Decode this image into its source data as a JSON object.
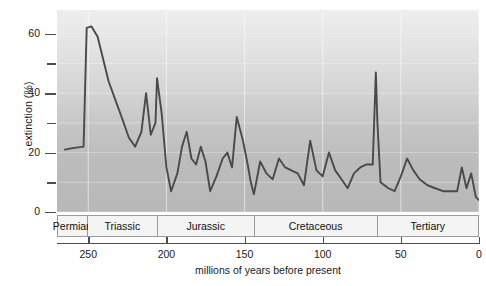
{
  "chart_data": {
    "type": "line",
    "title": "",
    "xlabel": "millions of years before present",
    "ylabel": "extinction (%)",
    "xlim": [
      270,
      0
    ],
    "ylim": [
      0,
      68
    ],
    "x_reversed": true,
    "grid": true,
    "legend": null,
    "y_ticks_major": [
      0,
      20,
      40,
      60
    ],
    "y_ticks_minor": [
      10,
      30,
      50
    ],
    "x_ticks": [
      250,
      200,
      150,
      100,
      50,
      0
    ],
    "period_bands": [
      {
        "label": "Permian",
        "start": 270,
        "end": 251
      },
      {
        "label": "Triassic",
        "start": 251,
        "end": 206
      },
      {
        "label": "Jurassic",
        "start": 206,
        "end": 144
      },
      {
        "label": "Cretaceous",
        "start": 144,
        "end": 65
      },
      {
        "label": "Tertiary",
        "start": 65,
        "end": 0
      }
    ],
    "series": [
      {
        "name": "extinction rate",
        "color": "#4a4a4a",
        "points": [
          [
            265,
            21
          ],
          [
            260,
            21.5
          ],
          [
            253,
            22
          ],
          [
            251,
            62
          ],
          [
            248,
            62.5
          ],
          [
            244,
            59
          ],
          [
            237,
            44
          ],
          [
            228,
            31
          ],
          [
            224,
            25
          ],
          [
            220,
            22
          ],
          [
            216,
            27
          ],
          [
            213,
            40
          ],
          [
            210,
            26
          ],
          [
            207,
            30
          ],
          [
            206,
            45
          ],
          [
            203,
            33
          ],
          [
            200,
            15
          ],
          [
            197,
            7
          ],
          [
            193,
            13
          ],
          [
            190,
            22
          ],
          [
            187,
            27
          ],
          [
            184,
            18
          ],
          [
            181,
            16
          ],
          [
            178,
            22
          ],
          [
            175,
            17
          ],
          [
            172,
            7
          ],
          [
            168,
            12
          ],
          [
            164,
            18
          ],
          [
            161,
            20
          ],
          [
            158,
            15
          ],
          [
            155,
            32
          ],
          [
            151,
            24
          ],
          [
            148,
            16
          ],
          [
            146,
            10
          ],
          [
            144,
            6
          ],
          [
            140,
            17
          ],
          [
            136,
            13
          ],
          [
            132,
            11
          ],
          [
            128,
            18
          ],
          [
            124,
            15
          ],
          [
            120,
            14
          ],
          [
            116,
            13
          ],
          [
            112,
            9
          ],
          [
            108,
            24
          ],
          [
            104,
            14
          ],
          [
            100,
            12
          ],
          [
            96,
            20
          ],
          [
            92,
            14
          ],
          [
            88,
            11
          ],
          [
            84,
            8
          ],
          [
            80,
            13
          ],
          [
            76,
            15
          ],
          [
            72,
            16
          ],
          [
            68,
            16
          ],
          [
            66,
            47
          ],
          [
            65,
            30
          ],
          [
            63,
            10
          ],
          [
            58,
            8
          ],
          [
            54,
            7
          ],
          [
            50,
            12
          ],
          [
            46,
            18
          ],
          [
            42,
            14
          ],
          [
            38,
            11
          ],
          [
            33,
            9
          ],
          [
            28,
            8
          ],
          [
            23,
            7
          ],
          [
            18,
            7
          ],
          [
            14,
            7
          ],
          [
            11,
            15
          ],
          [
            8,
            8
          ],
          [
            5,
            13
          ],
          [
            2,
            5
          ],
          [
            0,
            4
          ]
        ]
      }
    ]
  },
  "axes": {
    "ylabel": "extinction (%)",
    "xlabel": "millions of years before present",
    "y_tick_labels": [
      "60",
      "40",
      "20",
      "0"
    ],
    "x_tick_labels": [
      "250",
      "200",
      "150",
      "100",
      "50",
      "0"
    ]
  },
  "periods": [
    {
      "label": "Permian"
    },
    {
      "label": "Triassic"
    },
    {
      "label": "Jurassic"
    },
    {
      "label": "Cretaceous"
    },
    {
      "label": "Tertiary"
    }
  ],
  "colors": {
    "line": "#4a4a4a",
    "plot_background_top": "#eeeeee",
    "plot_background_bottom": "#b8b8b8",
    "axis": "#4d4d4d",
    "text": "#1a1a1a",
    "band_background": "#f4f4f4",
    "band_border": "#9a9a9a"
  }
}
